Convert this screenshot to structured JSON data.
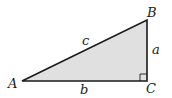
{
  "diagram": {
    "type": "right-triangle",
    "fill_color": "#e0e0e0",
    "stroke_color": "#1a1a1a",
    "vertices": {
      "A": {
        "label": "A",
        "x": 22,
        "y": 81
      },
      "B": {
        "label": "B",
        "x": 147,
        "y": 20
      },
      "C": {
        "label": "C",
        "x": 147,
        "y": 81
      }
    },
    "sides": {
      "a": {
        "label": "a",
        "between": "B-C"
      },
      "b": {
        "label": "b",
        "between": "A-C"
      },
      "c": {
        "label": "c",
        "between": "A-B"
      }
    },
    "right_angle_at": "C"
  }
}
